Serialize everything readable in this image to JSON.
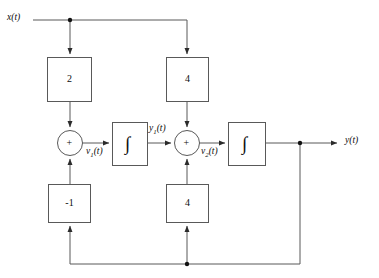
{
  "figure": {
    "kind": "block-diagram",
    "line_color": "#595959",
    "text_color": "#0d0d0d"
  },
  "signals": {
    "input": "x(t)",
    "output": "y(t)",
    "v1": "v",
    "v1_sub": "1",
    "v1_suffix": "(t)",
    "v2": "v",
    "v2_sub": "2",
    "v2_suffix": "(t)",
    "y1": "y",
    "y1_sub": "1",
    "y1_suffix": "(t)"
  },
  "blocks": {
    "gain_top_left": "2",
    "gain_top_right": "4",
    "gain_bottom_left": "-1",
    "gain_bottom_right": "4",
    "integrator_symbol": "∫"
  },
  "summers": {
    "summer_left_sign": "+",
    "summer_right_sign": "+"
  }
}
